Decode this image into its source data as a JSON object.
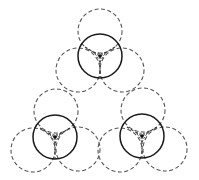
{
  "diagram": {
    "title": "",
    "colors": {
      "background": "#ffffff",
      "solid_stroke": "#1a1a1a",
      "dashed_stroke": "#555555",
      "center_dot": "#111111"
    },
    "radius": 22,
    "clusters": [
      {
        "id": "top",
        "center": [
          100,
          56
        ],
        "dashed_circles": [
          [
            100,
            31
          ],
          [
            78,
            70
          ],
          [
            122,
            70
          ]
        ],
        "y_ends": [
          [
            85,
            47
          ],
          [
            115,
            47
          ],
          [
            100,
            78
          ]
        ]
      },
      {
        "id": "bottom-left",
        "center": [
          55,
          137
        ],
        "dashed_circles": [
          [
            56,
            111
          ],
          [
            33,
            150
          ],
          [
            78,
            149
          ]
        ],
        "y_ends": [
          [
            40,
            128
          ],
          [
            70,
            128
          ],
          [
            55,
            159
          ]
        ]
      },
      {
        "id": "bottom-right",
        "center": [
          142,
          136
        ],
        "dashed_circles": [
          [
            143,
            110
          ],
          [
            120,
            150
          ],
          [
            165,
            149
          ]
        ],
        "y_ends": [
          [
            127,
            127
          ],
          [
            157,
            127
          ],
          [
            142,
            158
          ]
        ]
      }
    ]
  }
}
